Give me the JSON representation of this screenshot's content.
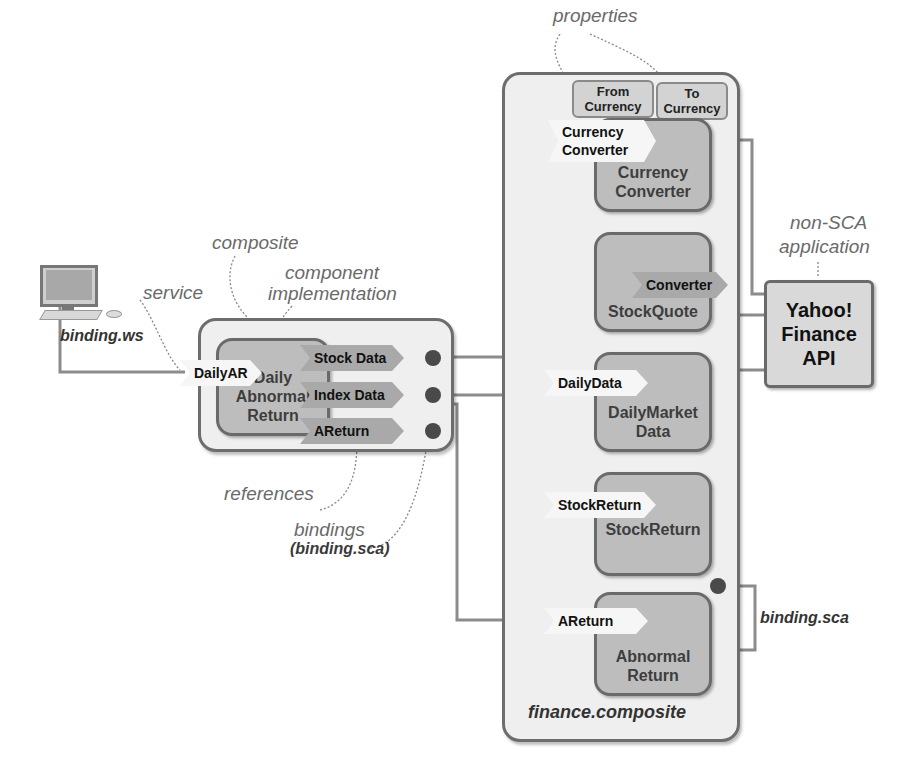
{
  "annotations": {
    "properties": "properties",
    "composite": "composite",
    "component_implementation_1": "component",
    "component_implementation_2": "implementation",
    "service": "service",
    "non_sca_1": "non-SCA",
    "non_sca_2": "application",
    "references": "references",
    "bindings": "bindings",
    "bindings_sca": "(binding.sca)"
  },
  "client": {
    "binding_label": "binding.ws",
    "icon": "desktop-computer-icon"
  },
  "left_composite": {
    "component": {
      "line1": "Daily",
      "line2": "Abnormal",
      "line3": "Return"
    },
    "service": "DailyAR",
    "references": [
      "Stock Data",
      "Index Data",
      "AReturn"
    ]
  },
  "finance_composite": {
    "name": "finance.composite",
    "properties": [
      {
        "line1": "From",
        "line2": "Currency"
      },
      {
        "line1": "To",
        "line2": "Currency"
      }
    ],
    "components": [
      {
        "id": "currency-converter",
        "line1": "Currency",
        "line2": "Converter",
        "service": {
          "line1": "Currency",
          "line2": "Converter"
        }
      },
      {
        "id": "stock-quote",
        "line1": "StockQuote",
        "line2": "",
        "reference": "Converter"
      },
      {
        "id": "daily-market-data",
        "line1": "DailyMarket",
        "line2": "Data",
        "service": "DailyData"
      },
      {
        "id": "stock-return",
        "line1": "StockReturn",
        "line2": "",
        "service": "StockReturn"
      },
      {
        "id": "abnormal-return",
        "line1": "Abnormal",
        "line2": "Return",
        "service": "AReturn"
      }
    ],
    "binding_label": "binding.sca"
  },
  "external": {
    "line1": "Yahoo!",
    "line2": "Finance",
    "line3": "API"
  }
}
